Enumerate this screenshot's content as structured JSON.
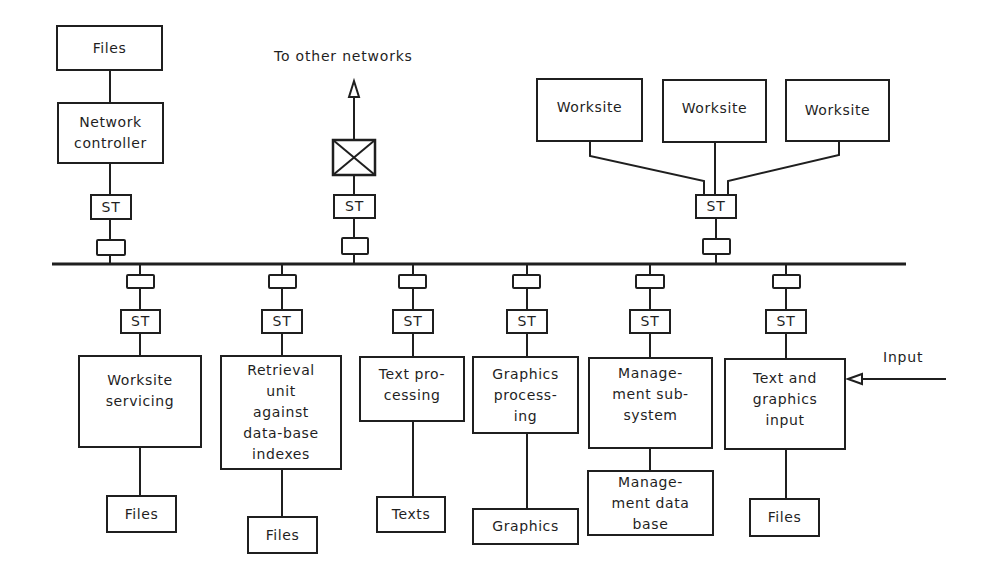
{
  "top": {
    "files": "Files",
    "network_controller": [
      "Network",
      "controller"
    ],
    "to_other_networks": "To other networks",
    "worksites": [
      "Worksite",
      "Worksite",
      "Worksite"
    ]
  },
  "station_label": "ST",
  "bottom": {
    "worksite_servicing": [
      "Worksite",
      "servicing"
    ],
    "retrieval_unit": [
      "Retrieval",
      "unit",
      "against",
      "data-base",
      "indexes"
    ],
    "text_processing": [
      "Text pro-",
      "cessing"
    ],
    "graphics_processing": [
      "Graphics",
      "process-",
      "ing"
    ],
    "management_subsystem": [
      "Manage-",
      "ment sub-",
      "system"
    ],
    "text_graphics_input": [
      "Text and",
      "graphics",
      "input"
    ],
    "storage": {
      "files_1": "Files",
      "files_2": "Files",
      "texts": "Texts",
      "graphics": "Graphics",
      "management_db": [
        "Manage-",
        "ment data",
        "base"
      ],
      "files_3": "Files"
    },
    "input_label": "Input"
  },
  "colors": {
    "ink": "#1f1f1f",
    "background": "#ffffff"
  }
}
